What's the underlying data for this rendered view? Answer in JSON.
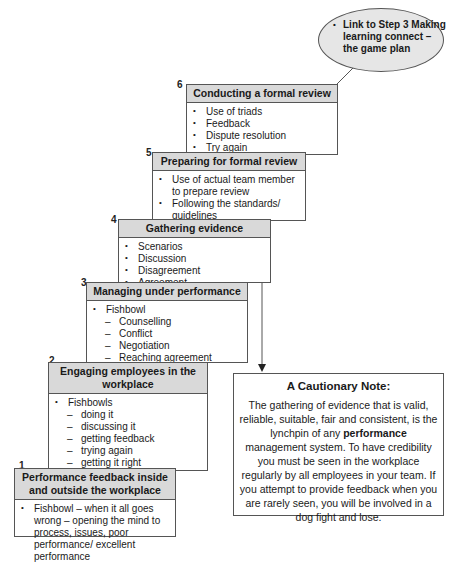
{
  "diagram": {
    "link": {
      "text": "Link to Step 3 Making learning connect – the game plan"
    },
    "steps": [
      {
        "number": "6",
        "title": "Conducting a formal review",
        "items": [
          {
            "type": "bullet",
            "text": "Use of triads"
          },
          {
            "type": "bullet",
            "text": "Feedback"
          },
          {
            "type": "bullet",
            "text": "Dispute resolution"
          },
          {
            "type": "bullet",
            "text": "Try again"
          }
        ]
      },
      {
        "number": "5",
        "title": "Preparing for formal review",
        "items": [
          {
            "type": "bullet",
            "text": "Use of actual team member to prepare review"
          },
          {
            "type": "bullet",
            "text": "Following the standards/ guidelines"
          }
        ]
      },
      {
        "number": "4",
        "title": "Gathering evidence",
        "items": [
          {
            "type": "bullet",
            "text": "Scenarios"
          },
          {
            "type": "bullet",
            "text": "Discussion"
          },
          {
            "type": "bullet",
            "text": "Disagreement"
          },
          {
            "type": "bullet",
            "text": "Agreement"
          }
        ]
      },
      {
        "number": "3",
        "title": "Managing under performance",
        "items": [
          {
            "type": "bullet",
            "text": "Fishbowl"
          },
          {
            "type": "sub",
            "text": "Counselling"
          },
          {
            "type": "sub",
            "text": "Conflict"
          },
          {
            "type": "sub",
            "text": "Negotiation"
          },
          {
            "type": "sub",
            "text": "Reaching agreement"
          }
        ]
      },
      {
        "number": "2",
        "title": "Engaging employees in the workplace",
        "items": [
          {
            "type": "bullet",
            "text": "Fishbowls"
          },
          {
            "type": "sub",
            "text": "doing it"
          },
          {
            "type": "sub",
            "text": "discussing it"
          },
          {
            "type": "sub",
            "text": "getting feedback"
          },
          {
            "type": "sub",
            "text": "trying again"
          },
          {
            "type": "sub",
            "text": "getting it right"
          }
        ]
      },
      {
        "number": "1",
        "title": "Performance feedback inside and outside the workplace",
        "items": [
          {
            "type": "bullet",
            "text": "Fishbowl – when it all goes wrong – opening the mind to process, issues, poor performance/ excellent performance"
          }
        ]
      }
    ],
    "note": {
      "title": "A Cautionary Note:",
      "body_before": "The gathering of evidence that is valid, reliable, suitable, fair and consistent, is the lynchpin of any ",
      "body_bold": "performance",
      "body_after": " management system. To have credibility you must be seen in the workplace regularly by all employees in your team. If you attempt to provide feedback when you are rarely seen, you will be involved in a dog fight and lose."
    },
    "colors": {
      "header_fill": "#d9d9d9",
      "ellipse_fill": "#e6e6e6",
      "border": "#555555"
    }
  }
}
